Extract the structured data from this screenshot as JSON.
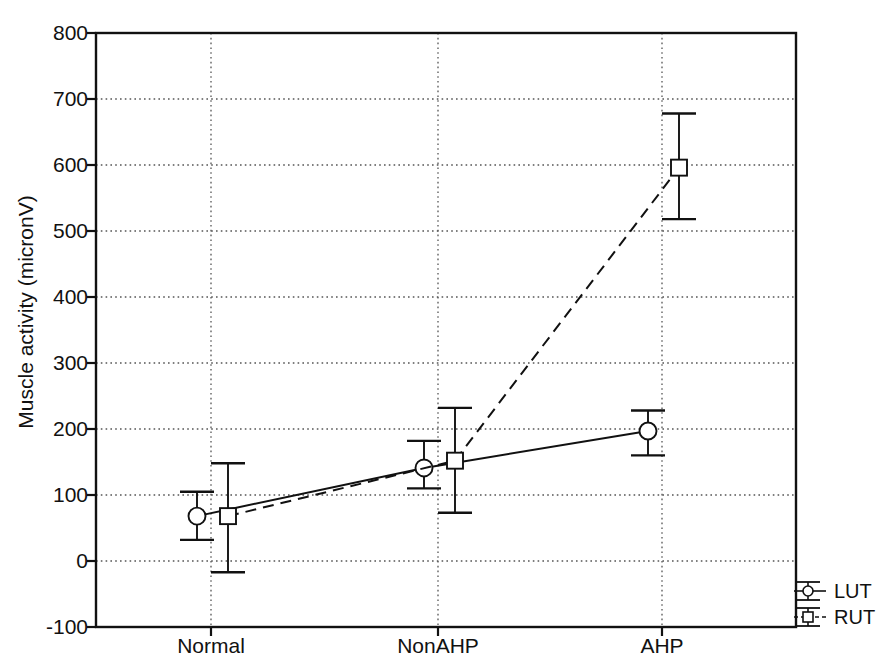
{
  "chart_data": {
    "type": "line",
    "title": "",
    "xlabel": "",
    "ylabel": "Muscle activity (micronV)",
    "categories": [
      "Normal",
      "NonAHP",
      "AHP"
    ],
    "ylim": [
      -100,
      800
    ],
    "yticks": [
      -100,
      0,
      100,
      200,
      300,
      400,
      500,
      600,
      700,
      800
    ],
    "ytick_labels": [
      "-100",
      "0",
      "100",
      "200",
      "300",
      "400",
      "500",
      "600",
      "700",
      "800"
    ],
    "grid": "dotted-both-axes",
    "legend_position": "outside-bottom-right",
    "series": [
      {
        "name": "LUT",
        "marker": "circle",
        "linestyle": "solid",
        "color": "#111111",
        "x_offset": -14,
        "values": [
          68,
          141,
          197
        ],
        "err_upper": [
          105,
          182,
          228
        ],
        "err_lower": [
          32,
          110,
          160
        ]
      },
      {
        "name": "RUT",
        "marker": "square",
        "linestyle": "dashed",
        "color": "#111111",
        "x_offset": 17,
        "values": [
          68,
          152,
          596
        ],
        "err_upper": [
          148,
          232,
          678
        ],
        "err_lower": [
          -17,
          73,
          518
        ]
      }
    ]
  },
  "axes": {
    "y_label_text": "Muscle activity (micronV)",
    "x_tick_labels": [
      "Normal",
      "NonAHP",
      "AHP"
    ],
    "y_tick_labels": [
      "800",
      "700",
      "600",
      "500",
      "400",
      "300",
      "200",
      "100",
      "0",
      "-100"
    ]
  },
  "legend": {
    "items": [
      {
        "label": "LUT",
        "marker": "circle-errorbar-icon"
      },
      {
        "label": "RUT",
        "marker": "square-errorbar-icon"
      }
    ]
  }
}
